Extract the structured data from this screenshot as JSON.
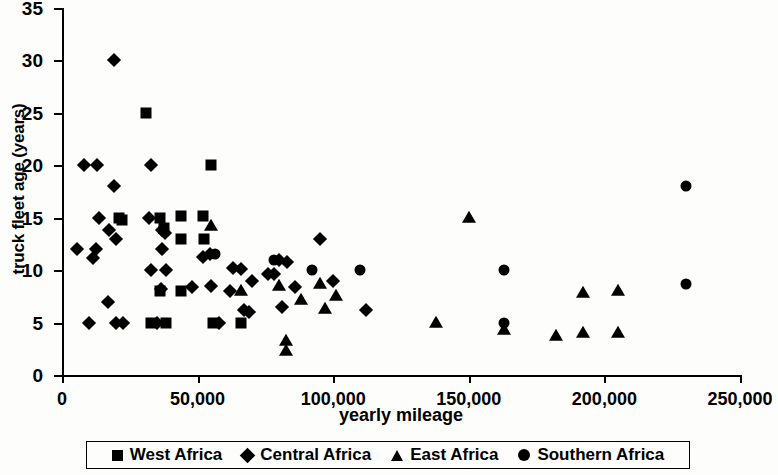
{
  "chart_data": {
    "type": "scatter",
    "title": "",
    "xlabel": "yearly mileage",
    "ylabel": "truck fleet age (years)",
    "xlim": [
      0,
      250000
    ],
    "ylim": [
      0,
      35
    ],
    "xticks": [
      0,
      50000,
      100000,
      150000,
      200000,
      250000
    ],
    "xtick_labels": [
      "0",
      "50,000",
      "100,000",
      "150,000",
      "200,000",
      "250,000"
    ],
    "yticks": [
      0,
      5,
      10,
      15,
      20,
      25,
      30,
      35
    ],
    "ytick_labels": [
      "0",
      "5",
      "10",
      "15",
      "20",
      "25",
      "30",
      "35"
    ],
    "grid": false,
    "legend_position": "bottom",
    "marker_color": "#000000",
    "series": [
      {
        "name": "West Africa",
        "marker": "square",
        "points": [
          [
            31000,
            25
          ],
          [
            55000,
            20
          ],
          [
            36000,
            15
          ],
          [
            44000,
            15.2
          ],
          [
            52000,
            15.2
          ],
          [
            37500,
            14
          ],
          [
            44000,
            13
          ],
          [
            52500,
            13
          ],
          [
            21000,
            15
          ],
          [
            36000,
            8
          ],
          [
            44000,
            8
          ],
          [
            33000,
            5
          ],
          [
            38500,
            5
          ],
          [
            55500,
            5
          ],
          [
            66000,
            5
          ],
          [
            22000,
            14.8
          ]
        ]
      },
      {
        "name": "Central Africa",
        "marker": "diamond",
        "points": [
          [
            19000,
            30
          ],
          [
            8000,
            20
          ],
          [
            13000,
            20
          ],
          [
            33000,
            20
          ],
          [
            19000,
            18
          ],
          [
            13500,
            15
          ],
          [
            32000,
            15
          ],
          [
            17500,
            13.8
          ],
          [
            37000,
            13.8
          ],
          [
            20000,
            13
          ],
          [
            38000,
            13.5
          ],
          [
            5500,
            12
          ],
          [
            12500,
            12
          ],
          [
            37000,
            12
          ],
          [
            11500,
            11.2
          ],
          [
            33000,
            10
          ],
          [
            38500,
            10
          ],
          [
            55000,
            8.5
          ],
          [
            36500,
            8.2
          ],
          [
            48000,
            8.4
          ],
          [
            17000,
            7
          ],
          [
            10000,
            5
          ],
          [
            20000,
            5
          ],
          [
            22500,
            5
          ],
          [
            35000,
            5
          ],
          [
            52000,
            11.3
          ],
          [
            54500,
            11.5
          ],
          [
            63000,
            10.2
          ],
          [
            66000,
            10.1
          ],
          [
            70000,
            9
          ],
          [
            67000,
            6.2
          ],
          [
            69000,
            6
          ],
          [
            76000,
            9.6
          ],
          [
            78000,
            9.6
          ],
          [
            80000,
            11
          ],
          [
            83000,
            10.8
          ],
          [
            81000,
            6.5
          ],
          [
            95000,
            13
          ],
          [
            100000,
            9
          ],
          [
            112000,
            6.2
          ],
          [
            62000,
            8
          ],
          [
            86000,
            8.4
          ],
          [
            58000,
            5
          ]
        ]
      },
      {
        "name": "East Africa",
        "marker": "triangle",
        "points": [
          [
            55000,
            14.2
          ],
          [
            66000,
            8
          ],
          [
            80000,
            8.5
          ],
          [
            88000,
            7.2
          ],
          [
            95000,
            8.7
          ],
          [
            101000,
            7.5
          ],
          [
            97000,
            6.3
          ],
          [
            82500,
            3.2
          ],
          [
            82500,
            2.3
          ],
          [
            138000,
            5
          ],
          [
            150000,
            15
          ],
          [
            163000,
            4.3
          ],
          [
            182000,
            3.7
          ],
          [
            192000,
            4
          ],
          [
            192000,
            7.8
          ],
          [
            205000,
            8
          ],
          [
            205000,
            4
          ]
        ]
      },
      {
        "name": "Southern Africa",
        "marker": "circle",
        "points": [
          [
            56500,
            11.5
          ],
          [
            78000,
            11
          ],
          [
            92000,
            10
          ],
          [
            110000,
            10
          ],
          [
            163000,
            10
          ],
          [
            163000,
            5
          ],
          [
            230000,
            18
          ],
          [
            230000,
            8.7
          ]
        ]
      }
    ]
  },
  "legend": {
    "items": [
      {
        "label": "West Africa",
        "marker": "square"
      },
      {
        "label": "Central Africa",
        "marker": "diamond"
      },
      {
        "label": "East Africa",
        "marker": "triangle"
      },
      {
        "label": "Southern Africa",
        "marker": "circle"
      }
    ]
  }
}
